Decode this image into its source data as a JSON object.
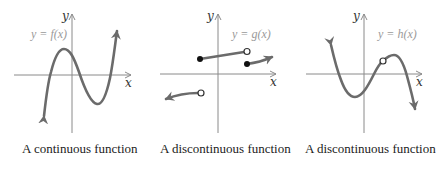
{
  "colors": {
    "axis": "#8a8a8a",
    "curve": "#6b6b6b",
    "function_label": "#9a9a9a",
    "caption": "#222222"
  },
  "graphs": [
    {
      "id": "f",
      "axis_x_label": "x",
      "axis_y_label": "y",
      "function_label": "y = f(x)",
      "caption": "A continuous function",
      "features": [
        "cubic-like curve",
        "arrow down at left end",
        "arrow up at right end",
        "no breaks"
      ]
    },
    {
      "id": "g",
      "axis_x_label": "x",
      "axis_y_label": "y",
      "function_label": "y = g(x)",
      "caption": "A discontinuous function",
      "features": [
        "left piece arrow left, open endpoint",
        "middle segment filled start, open end",
        "right piece filled start, arrow right",
        "jump discontinuities"
      ]
    },
    {
      "id": "h",
      "axis_x_label": "x",
      "axis_y_label": "y",
      "function_label": "y = h(x)",
      "caption": "A discontinuous function",
      "features": [
        "cubic-like curve",
        "arrow up at left end",
        "arrow down at right end",
        "removable discontinuity (open hole) near local max"
      ]
    }
  ]
}
